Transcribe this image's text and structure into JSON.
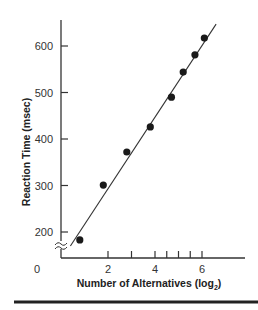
{
  "chart_data": {
    "type": "scatter",
    "title": "",
    "xlabel": "Number of Alternatives (log",
    "xlabel_subscript": "2",
    "xlabel_suffix": ")",
    "ylabel": "Reaction Time (msec)",
    "xlim": [
      0,
      7.5
    ],
    "ylim": [
      200,
      650
    ],
    "y_axis_break": true,
    "grid": false,
    "legend": "none",
    "x_tick_labels": [
      {
        "value": 0,
        "label": "0"
      },
      {
        "value": 2,
        "label": "2"
      },
      {
        "value": 4,
        "label": "4"
      },
      {
        "value": 6,
        "label": "6"
      }
    ],
    "x_tick_marks": [
      2,
      3,
      4,
      4.5,
      5,
      5.5,
      6
    ],
    "y_ticks": [
      {
        "value": 200,
        "label": "200"
      },
      {
        "value": 300,
        "label": "300"
      },
      {
        "value": 400,
        "label": "400"
      },
      {
        "value": 500,
        "label": "500"
      },
      {
        "value": 600,
        "label": "600"
      }
    ],
    "series": [
      {
        "name": "Observed",
        "x": [
          0.8,
          1.8,
          2.8,
          3.8,
          4.7,
          5.2,
          5.7,
          6.1
        ],
        "y": [
          183,
          301,
          372,
          426,
          490,
          544,
          581,
          617
        ]
      }
    ],
    "fit_line": {
      "x": [
        0.4,
        6.6
      ],
      "y": [
        170,
        647
      ]
    }
  }
}
